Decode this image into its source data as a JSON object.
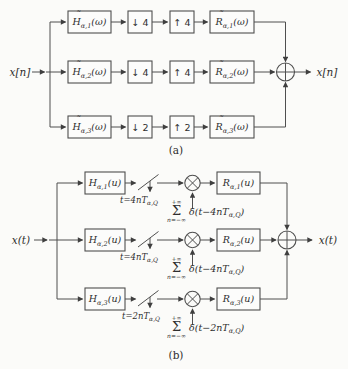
{
  "figure": {
    "caption_a": "(a)",
    "caption_b": "(b)"
  },
  "diagram_a": {
    "input_label": "x[n]",
    "output_label": "x[n]",
    "rows": [
      {
        "analysis": {
          "tilde": "˜",
          "letter": "H",
          "sub": "α,1",
          "arg": "(ω)"
        },
        "downsampler": "↓ 4",
        "upsampler": "↑ 4",
        "synthesis": {
          "tilde": "˜",
          "letter": "R",
          "sub": "α,1",
          "arg": "(ω)"
        }
      },
      {
        "analysis": {
          "tilde": "˜",
          "letter": "H",
          "sub": "α,2",
          "arg": "(ω)"
        },
        "downsampler": "↓ 4",
        "upsampler": "↑ 4",
        "synthesis": {
          "tilde": "˜",
          "letter": "R",
          "sub": "α,2",
          "arg": "(ω)"
        }
      },
      {
        "analysis": {
          "tilde": "˜",
          "letter": "H",
          "sub": "α,3",
          "arg": "(ω)"
        },
        "downsampler": "↓ 2",
        "upsampler": "↑ 2",
        "synthesis": {
          "tilde": "˜",
          "letter": "R",
          "sub": "α,3",
          "arg": "(ω)"
        }
      }
    ]
  },
  "diagram_b": {
    "input_label": "x(t)",
    "output_label": "x(t)",
    "rows": [
      {
        "filter": {
          "letter": "H",
          "sub": "α,1",
          "arg": "(u)"
        },
        "sampling": {
          "pre": "t=4nT",
          "sub": "α,Q"
        },
        "train": {
          "upper": "+∞",
          "sigma": "Σ",
          "lower": "n=−∞",
          "delta_pre": "δ(t−4nT",
          "delta_sub": "α,Q",
          "delta_post": ")"
        },
        "recon": {
          "letter": "R",
          "sub": "α,1",
          "arg": "(u)"
        }
      },
      {
        "filter": {
          "letter": "H",
          "sub": "α,2",
          "arg": "(u)"
        },
        "sampling": {
          "pre": "t=4nT",
          "sub": "α,Q"
        },
        "train": {
          "upper": "+∞",
          "sigma": "Σ",
          "lower": "n=−∞",
          "delta_pre": "δ(t−4nT",
          "delta_sub": "α,Q",
          "delta_post": ")"
        },
        "recon": {
          "letter": "R",
          "sub": "α,2",
          "arg": "(u)"
        }
      },
      {
        "filter": {
          "letter": "H",
          "sub": "α,3",
          "arg": "(u)"
        },
        "sampling": {
          "pre": "t=2nT",
          "sub": "α,Q"
        },
        "train": {
          "upper": "+∞",
          "sigma": "Σ",
          "lower": "n=−∞",
          "delta_pre": "δ(t−2nT",
          "delta_sub": "α,Q",
          "delta_post": ")"
        },
        "recon": {
          "letter": "R",
          "sub": "α,3",
          "arg": "(u)"
        }
      }
    ]
  }
}
